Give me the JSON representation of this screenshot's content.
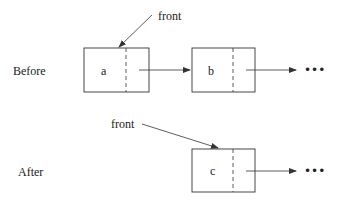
{
  "diagram": {
    "type": "linked-list-before-after",
    "before": {
      "label": "Before",
      "pointer_label": "front",
      "nodes": [
        {
          "value": "a"
        },
        {
          "value": "b"
        }
      ],
      "continuation": "•••"
    },
    "after": {
      "label": "After",
      "pointer_label": "front",
      "nodes": [
        {
          "value": "c"
        }
      ],
      "continuation": "•••"
    },
    "colors": {
      "line": "#333333",
      "text": "#222222",
      "background": "#ffffff"
    }
  }
}
